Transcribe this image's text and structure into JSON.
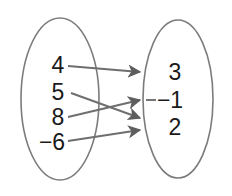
{
  "diagram": {
    "type": "mapping-diagram",
    "title": "",
    "background_color": "#ffffff",
    "stroke_color": "#767676",
    "text_color": "#1a1a1a",
    "domain_set": {
      "name": "domain",
      "elements": [
        {
          "label": "4",
          "x": 58,
          "y": 73
        },
        {
          "label": "5",
          "x": 58,
          "y": 100
        },
        {
          "label": "8",
          "x": 58,
          "y": 125
        },
        {
          "label": "−6",
          "x": 52,
          "y": 150
        }
      ],
      "ellipse": {
        "cx": 60,
        "cy": 99,
        "rx": 39,
        "ry": 81
      }
    },
    "range_set": {
      "name": "range",
      "elements": [
        {
          "label": "3",
          "x": 173,
          "y": 80
        },
        {
          "label": "−1",
          "x": 162,
          "y": 108
        },
        {
          "label": "2",
          "x": 173,
          "y": 135
        }
      ],
      "ellipse": {
        "cx": 178,
        "cy": 99,
        "rx": 35,
        "ry": 79
      }
    },
    "arrows": [
      {
        "from": "4",
        "to": "3",
        "x1": 68,
        "y1": 66,
        "x2": 140,
        "y2": 72
      },
      {
        "from": "5",
        "to": "2",
        "x1": 71,
        "y1": 93,
        "x2": 140,
        "y2": 118
      },
      {
        "from": "8",
        "to": "−1",
        "x1": 68,
        "y1": 117,
        "x2": 140,
        "y2": 100
      },
      {
        "from": "−6",
        "to": "2",
        "x1": 68,
        "y1": 141,
        "x2": 140,
        "y2": 130
      }
    ],
    "connector_dash": {
      "x1": 146,
      "y1": 100,
      "x2": 155,
      "y2": 100
    }
  }
}
